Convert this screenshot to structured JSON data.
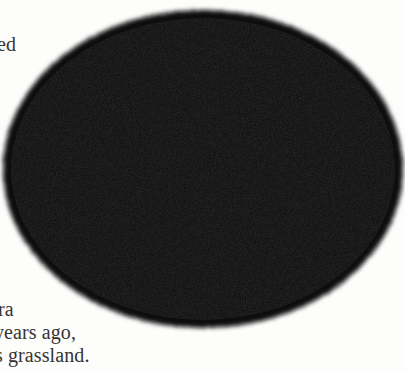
{
  "page": {
    "background": "#fdfdfc",
    "text_color": "#353535"
  },
  "text_fragments": {
    "top": [
      "ed"
    ],
    "bottom": [
      "ra",
      "years ago,",
      "s grassland."
    ]
  },
  "figure": {
    "shape": "oval",
    "fill": "#0a0a0a",
    "edge": "fuzzy/feathered",
    "center": [
      203,
      169
    ],
    "radii": [
      200,
      159
    ]
  }
}
